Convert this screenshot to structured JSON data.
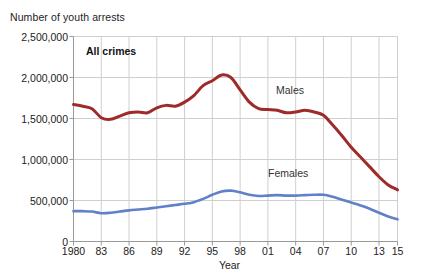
{
  "chart_data": {
    "type": "line",
    "title": "",
    "ylabel": "Number of youth arrests",
    "xlabel": "Year",
    "panel_label": "All crimes",
    "ylim": [
      0,
      2500000
    ],
    "xlim": [
      1980,
      2015
    ],
    "grid": true,
    "legend_position": "inline-labels",
    "ytick_labels": [
      "0",
      "500,000",
      "1,000,000",
      "1,500,000",
      "2,000,000",
      "2,500,000"
    ],
    "ytick_values": [
      0,
      500000,
      1000000,
      1500000,
      2000000,
      2500000
    ],
    "xtick_labels": [
      "1980",
      "83",
      "86",
      "89",
      "92",
      "95",
      "98",
      "01",
      "04",
      "07",
      "10",
      "13",
      "15"
    ],
    "xtick_values": [
      1980,
      1983,
      1986,
      1989,
      1992,
      1995,
      1998,
      2001,
      2004,
      2007,
      2010,
      2013,
      2015
    ],
    "x": [
      1980,
      1981,
      1982,
      1983,
      1984,
      1985,
      1986,
      1987,
      1988,
      1989,
      1990,
      1991,
      1992,
      1993,
      1994,
      1995,
      1996,
      1997,
      1998,
      1999,
      2000,
      2001,
      2002,
      2003,
      2004,
      2005,
      2006,
      2007,
      2008,
      2009,
      2010,
      2011,
      2012,
      2013,
      2014,
      2015
    ],
    "series": [
      {
        "name": "Males",
        "color": "#9e2a2a",
        "values": [
          1670000,
          1650000,
          1620000,
          1510000,
          1490000,
          1530000,
          1570000,
          1580000,
          1570000,
          1630000,
          1660000,
          1650000,
          1700000,
          1780000,
          1900000,
          1960000,
          2030000,
          2000000,
          1850000,
          1700000,
          1620000,
          1610000,
          1600000,
          1570000,
          1580000,
          1600000,
          1580000,
          1540000,
          1420000,
          1290000,
          1150000,
          1030000,
          910000,
          790000,
          690000,
          630000
        ]
      },
      {
        "name": "Females",
        "color": "#6080c8",
        "values": [
          370000,
          370000,
          365000,
          345000,
          350000,
          365000,
          380000,
          390000,
          400000,
          415000,
          430000,
          445000,
          460000,
          480000,
          520000,
          570000,
          610000,
          620000,
          600000,
          570000,
          555000,
          560000,
          565000,
          560000,
          560000,
          565000,
          570000,
          570000,
          545000,
          510000,
          475000,
          440000,
          400000,
          350000,
          305000,
          270000
        ]
      }
    ]
  }
}
